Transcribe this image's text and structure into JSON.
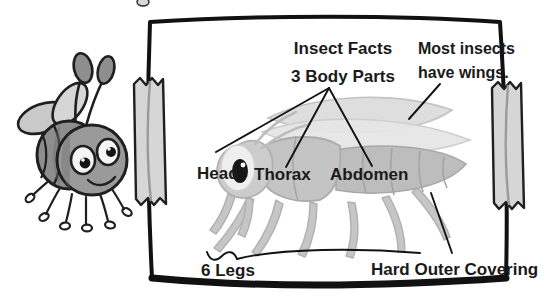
{
  "poster": {
    "title": "Insect Facts",
    "subtitle": "3 Body Parts",
    "wings_note_line1": "Most insects",
    "wings_note_line2": "have wings.",
    "label_head": "Head",
    "label_thorax": "Thorax",
    "label_abdomen": "Abdomen",
    "label_legs": "6 Legs",
    "label_covering": "Hard Outer Covering"
  },
  "colors": {
    "ink": "#1a1a1a",
    "paper": "#ffffff",
    "tape": "#d4d4d4",
    "tape_edge": "#9a9a9a",
    "insect_body": "#b9b9b9",
    "insect_body_dark": "#a0a0a0",
    "insect_light": "#d8d8d8",
    "wing": "#e2e2e2",
    "bee_body": "#8e8e8e",
    "bee_dark": "#6e6e6e",
    "bee_light": "#c9c9c9",
    "eye_white": "#f2f2f2",
    "pupil": "#111111"
  },
  "mascot": {
    "name": "cartoon bee mascot",
    "antennae": 2,
    "legs": 6,
    "wings": 2,
    "eyes": 2
  },
  "diagram": {
    "name": "insect anatomy diagram",
    "body_parts": 3,
    "legs": 6,
    "wings": 2,
    "leader_lines": 5
  }
}
